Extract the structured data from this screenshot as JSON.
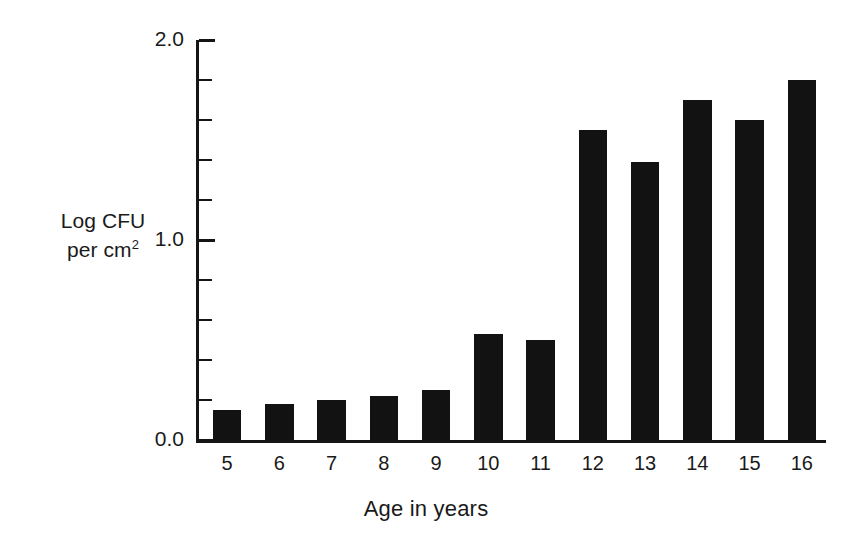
{
  "chart_data": {
    "type": "bar",
    "title": "",
    "xlabel": "Age in years",
    "ylabel": "Log CFU per cm2",
    "ylabel_line1": "Log CFU",
    "ylabel_line2_prefix": "per cm",
    "ylabel_line2_sup": "2",
    "categories": [
      "5",
      "6",
      "7",
      "8",
      "9",
      "10",
      "11",
      "12",
      "13",
      "14",
      "15",
      "16"
    ],
    "values": [
      0.15,
      0.18,
      0.2,
      0.22,
      0.25,
      0.53,
      0.5,
      1.55,
      1.39,
      1.7,
      1.6,
      1.8
    ],
    "ylim": [
      0.0,
      2.0
    ],
    "ytick_major_labels": [
      "0.0",
      "1.0",
      "2.0"
    ],
    "ytick_major_values": [
      0.0,
      1.0,
      2.0
    ],
    "ytick_minor_values": [
      0.2,
      0.4,
      0.6,
      0.8,
      1.2,
      1.4,
      1.6,
      1.8
    ],
    "grid": false,
    "legend": "none",
    "bar_color": "#121212",
    "axis_color": "#151515",
    "background_color": "#ffffff"
  }
}
